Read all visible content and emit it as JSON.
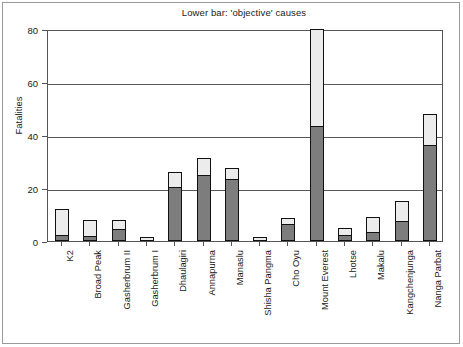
{
  "chart_data": {
    "type": "bar",
    "subtype": "stacked-bar",
    "title": "Lower bar: 'objective' causes",
    "xlabel": "",
    "ylabel": "Fatalities",
    "ylim": [
      0,
      80
    ],
    "yticks": [
      0,
      20,
      40,
      60,
      80
    ],
    "grid": "horizontal",
    "legend": "none",
    "categories": [
      "K2",
      "Broad Peak",
      "Gasherbrum II",
      "Gasherbrum I",
      "Dhaulagiri",
      "Annapurna",
      "Manaslu",
      "Shisha Pangma",
      "Cho Oyu",
      "Mount Everest",
      "Lhotse",
      "Makalu",
      "Kangchenjunga",
      "Nanga Parbat"
    ],
    "series": [
      {
        "name": "'objective' causes",
        "position": "lower",
        "color": "#7d7d7d",
        "values": [
          2,
          1.5,
          4,
          0,
          20,
          24.5,
          23,
          0,
          6,
          43,
          2,
          3,
          7,
          36
        ]
      },
      {
        "name": "other causes",
        "position": "upper",
        "color": "#ececec",
        "values": [
          10,
          6.5,
          4,
          1.5,
          6,
          7,
          4.5,
          1.5,
          2.5,
          37,
          3,
          6,
          8,
          12
        ]
      }
    ],
    "totals": [
      12,
      8,
      8,
      1.5,
      26,
      31.5,
      27.5,
      1.5,
      8.5,
      80,
      5,
      9,
      15,
      48
    ]
  }
}
